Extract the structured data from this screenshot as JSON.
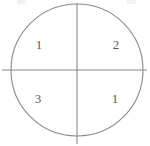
{
  "figure": {
    "type": "quadrant-circle-diagram",
    "background_color": "#ffffff",
    "stroke_color": "#8a8a8a",
    "label_color": "#5a5a5a",
    "circle": {
      "center_x": 77,
      "center_y": 70,
      "radius": 66
    },
    "vertical_divider": {
      "x": 77,
      "y_start": 3,
      "y_end": 144
    },
    "horizontal_divider": {
      "y": 70,
      "x_start": 2,
      "x_end": 147
    },
    "quadrants": [
      {
        "position": "upper-left",
        "value": "1",
        "x": 39,
        "y": 44
      },
      {
        "position": "upper-right",
        "value": "2",
        "x": 116,
        "y": 44
      },
      {
        "position": "lower-left",
        "value": "3",
        "x": 38,
        "y": 98
      },
      {
        "position": "lower-right",
        "value": "1",
        "x": 115,
        "y": 98
      }
    ]
  }
}
